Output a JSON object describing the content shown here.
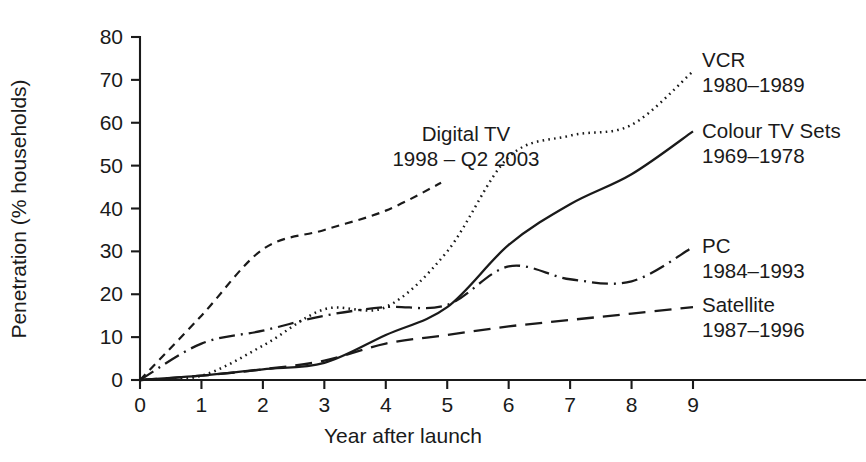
{
  "chart_data": {
    "type": "line",
    "title": "",
    "xlabel": "Year after launch",
    "ylabel": "Penetration (% households)",
    "xlim": [
      0,
      9
    ],
    "ylim": [
      0,
      80
    ],
    "grid": false,
    "legend_position": "right-of-plot-inline",
    "x_ticks": [
      "0",
      "1",
      "2",
      "3",
      "4",
      "5",
      "6",
      "7",
      "8",
      "9"
    ],
    "y_ticks": [
      "0",
      "10",
      "20",
      "30",
      "40",
      "50",
      "60",
      "70",
      "80"
    ],
    "x": [
      0,
      1,
      2,
      3,
      4,
      5,
      6,
      7,
      8,
      9
    ],
    "series": [
      {
        "name": "VCR",
        "period": "1980–1989",
        "label_line1": "VCR",
        "label_line2": "1980–1989",
        "style": "dotted",
        "color": "#1a1a1a",
        "x": [
          0,
          1,
          2,
          3,
          4,
          5,
          6,
          7,
          8,
          9
        ],
        "values": [
          0,
          1,
          8,
          16.5,
          17,
          30,
          52,
          57,
          59.5,
          72
        ]
      },
      {
        "name": "Colour TV Sets",
        "period": "1969–1978",
        "label_line1": "Colour TV Sets",
        "label_line2": "1969–1978",
        "style": "solid",
        "color": "#1a1a1a",
        "x": [
          0,
          1,
          2,
          3,
          4,
          5,
          6,
          7,
          8,
          9
        ],
        "values": [
          0,
          1,
          2.5,
          4,
          10.5,
          17,
          31.5,
          41,
          48,
          58
        ]
      },
      {
        "name": "Digital TV",
        "period": "1998 – Q2 2003",
        "label_line1": "Digital TV",
        "label_line2": "1998 – Q2 2003",
        "style": "dashed-short",
        "color": "#1a1a1a",
        "x": [
          0,
          1,
          2,
          3,
          4,
          4.9
        ],
        "values": [
          0,
          15,
          30.5,
          35,
          39.5,
          46
        ]
      },
      {
        "name": "PC",
        "period": "1984–1993",
        "label_line1": "PC",
        "label_line2": "1984–1993",
        "style": "dash-dot",
        "color": "#1a1a1a",
        "x": [
          0,
          1,
          2,
          3,
          4,
          5,
          6,
          7,
          8,
          9
        ],
        "values": [
          0,
          8.5,
          11.5,
          15,
          17,
          17.5,
          26.5,
          23.5,
          23,
          31
        ]
      },
      {
        "name": "Satellite",
        "period": "1987–1996",
        "label_line1": "Satellite",
        "label_line2": "1987–1996",
        "style": "dashed-long",
        "color": "#1a1a1a",
        "x": [
          0,
          1,
          2,
          3,
          4,
          5,
          6,
          7,
          8,
          9
        ],
        "values": [
          0,
          1,
          2.5,
          4.5,
          8.5,
          10.5,
          12.5,
          14,
          15.5,
          17
        ]
      }
    ],
    "annotations": [
      {
        "name": "digital-tv-annotation",
        "line1": "Digital TV",
        "line2": "1998 – Q2 2003"
      }
    ]
  }
}
